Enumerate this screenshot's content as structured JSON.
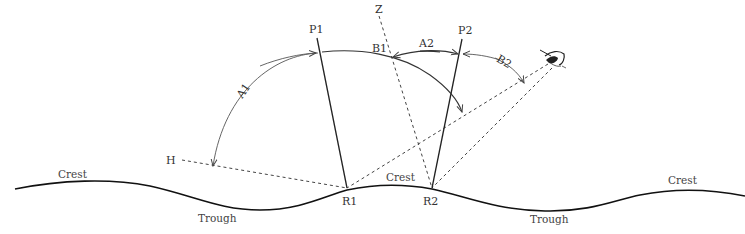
{
  "diagram": {
    "type": "specular reflection geometry over wavy surface",
    "points": {
      "P1": "P1",
      "P2": "P2",
      "Z": "Z",
      "H": "H",
      "R1": "R1",
      "R2": "R2"
    },
    "angles": {
      "A1": "A1",
      "B1": "B1",
      "A2": "A2",
      "B2": "B2"
    },
    "surface_labels": {
      "crest_left": "Crest",
      "crest_center": "Crest",
      "crest_right": "Crest",
      "trough_left": "Trough",
      "trough_right": "Trough"
    },
    "observer_icon": "eye-icon",
    "colors": {
      "line": "#222222",
      "dashed": "#444444",
      "arc": "#555555",
      "text": "#333333",
      "background": "#ffffff"
    }
  }
}
